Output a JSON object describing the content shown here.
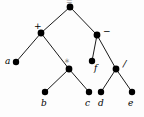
{
  "figure": {
    "kind": "binary-expression-tree",
    "background_color": "#fdfdfd",
    "node_color": "#000000",
    "edge_color": "#1a1a1a",
    "width": 144,
    "height": 117
  },
  "chart_data": {
    "type": "diagram",
    "title": "",
    "nodes": [
      {
        "id": "root",
        "label": "=",
        "kind": "operator",
        "x": 70,
        "y": 7,
        "label_x": 66,
        "label_y": -2,
        "label_style": "clipped",
        "clipped": true
      },
      {
        "id": "plus",
        "label": "+",
        "kind": "operator",
        "x": 41,
        "y": 33,
        "label_x": 34,
        "label_y": 22,
        "label_style": "op"
      },
      {
        "id": "minus",
        "label": "−",
        "kind": "operator",
        "x": 97,
        "y": 35,
        "label_x": 103,
        "label_y": 27,
        "label_style": "op"
      },
      {
        "id": "a",
        "label": "a",
        "kind": "leaf",
        "x": 16,
        "y": 62,
        "label_x": 5,
        "label_y": 57,
        "label_style": "var"
      },
      {
        "id": "star",
        "label": "∗",
        "kind": "operator",
        "x": 69,
        "y": 69,
        "label_x": 64,
        "label_y": 58,
        "label_style": "op-star"
      },
      {
        "id": "f",
        "label": "f",
        "kind": "leaf",
        "x": 92,
        "y": 61,
        "label_x": 94,
        "label_y": 64,
        "label_style": "var"
      },
      {
        "id": "slash",
        "label": "/",
        "kind": "operator",
        "x": 116,
        "y": 69,
        "label_x": 123,
        "label_y": 59,
        "label_style": "op-slash"
      },
      {
        "id": "b",
        "label": "b",
        "kind": "leaf",
        "x": 45,
        "y": 92,
        "label_x": 41,
        "label_y": 99,
        "label_style": "var"
      },
      {
        "id": "c",
        "label": "c",
        "kind": "leaf",
        "x": 89,
        "y": 92,
        "label_x": 85,
        "label_y": 99,
        "label_style": "var"
      },
      {
        "id": "d",
        "label": "d",
        "kind": "leaf",
        "x": 101,
        "y": 92,
        "label_x": 98,
        "label_y": 99,
        "label_style": "var"
      },
      {
        "id": "e",
        "label": "e",
        "kind": "leaf",
        "x": 132,
        "y": 92,
        "label_x": 128,
        "label_y": 99,
        "label_style": "var"
      }
    ],
    "edges": [
      {
        "from": "root",
        "to": "plus"
      },
      {
        "from": "root",
        "to": "minus"
      },
      {
        "from": "plus",
        "to": "a"
      },
      {
        "from": "plus",
        "to": "star"
      },
      {
        "from": "minus",
        "to": "f"
      },
      {
        "from": "minus",
        "to": "slash"
      },
      {
        "from": "star",
        "to": "b"
      },
      {
        "from": "star",
        "to": "c"
      },
      {
        "from": "slash",
        "to": "d"
      },
      {
        "from": "slash",
        "to": "e"
      }
    ]
  }
}
